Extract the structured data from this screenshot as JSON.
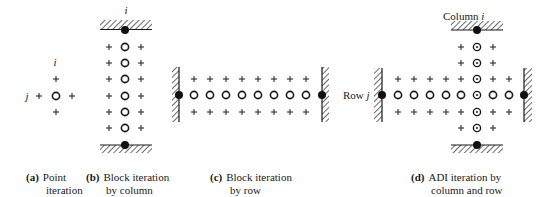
{
  "figure": {
    "panels": [
      {
        "id": "a",
        "caption_tag": "(a)",
        "caption_line1": "Point",
        "caption_line2": "iteration",
        "labels": {
          "column": "i",
          "row": "j"
        }
      },
      {
        "id": "b",
        "caption_tag": "(b)",
        "caption_line1": "Block iteration",
        "caption_line2": "by column",
        "labels": {
          "column": "i"
        }
      },
      {
        "id": "c",
        "caption_tag": "(c)",
        "caption_line1": "Block iteration",
        "caption_line2": "by row",
        "labels": {}
      },
      {
        "id": "d",
        "caption_tag": "(d)",
        "caption_line1": "ADI iteration by",
        "caption_line2": "column and row",
        "labels": {
          "column": "Column i",
          "row": "Row j"
        }
      }
    ],
    "legend_symbols": {
      "unknown_node": "open-circle",
      "known_node": "plus",
      "boundary_node": "filled-dot",
      "double_sweep_node": "circled-dot",
      "boundary": "hatched-wall"
    },
    "colors": {
      "ink": "#1a1a1a",
      "background": "#ffffff"
    }
  }
}
